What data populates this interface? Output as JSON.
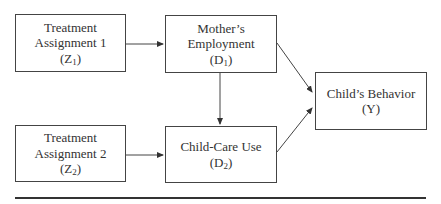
{
  "nodes": {
    "z1": {
      "line1": "Treatment",
      "line2": "Assignment 1",
      "symbol": "Z",
      "sub": "1"
    },
    "d1": {
      "line1": "Mother’s",
      "line2": "Employment",
      "symbol": "D",
      "sub": "1"
    },
    "z2": {
      "line1": "Treatment",
      "line2": "Assignment 2",
      "symbol": "Z",
      "sub": "2"
    },
    "d2": {
      "line1": "Child-Care Use",
      "symbol": "D",
      "sub": "2"
    },
    "y": {
      "line1": "Child’s Behavior",
      "symbol": "Y"
    }
  },
  "edges": [
    {
      "from": "Z1",
      "to": "D1"
    },
    {
      "from": "D1",
      "to": "D2"
    },
    {
      "from": "D1",
      "to": "Y"
    },
    {
      "from": "Z2",
      "to": "D2"
    },
    {
      "from": "D2",
      "to": "Y"
    }
  ],
  "colors": {
    "line": "#444444",
    "text": "#333333"
  }
}
